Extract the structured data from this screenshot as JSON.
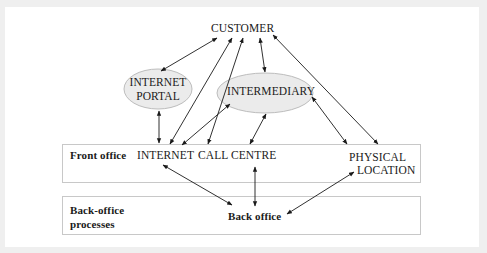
{
  "diagram": {
    "nodes": {
      "customer": "CUSTOMER",
      "internet_portal_line1": "INTERNET",
      "internet_portal_line2": "PORTAL",
      "intermediary": "INTERMEDIARY",
      "internet": "INTERNET",
      "call_centre": "CALL CENTRE",
      "physical_location_line1": "PHYSICAL",
      "physical_location_line2": "LOCATION",
      "back_office": "Back office"
    },
    "lanes": {
      "front_office": "Front office",
      "back_office_line1": "Back-office",
      "back_office_line2": "processes"
    },
    "edges": [
      {
        "from": "customer",
        "to": "internet_portal",
        "type": "bidirectional"
      },
      {
        "from": "customer",
        "to": "internet",
        "type": "bidirectional"
      },
      {
        "from": "customer",
        "to": "call_centre",
        "type": "bidirectional"
      },
      {
        "from": "customer",
        "to": "intermediary",
        "type": "bidirectional"
      },
      {
        "from": "customer",
        "to": "physical_location",
        "type": "bidirectional"
      },
      {
        "from": "internet_portal",
        "to": "internet",
        "type": "bidirectional"
      },
      {
        "from": "intermediary",
        "to": "internet",
        "type": "bidirectional"
      },
      {
        "from": "intermediary",
        "to": "call_centre",
        "type": "bidirectional"
      },
      {
        "from": "intermediary",
        "to": "physical_location",
        "type": "bidirectional"
      },
      {
        "from": "internet",
        "to": "back_office",
        "type": "bidirectional"
      },
      {
        "from": "call_centre",
        "to": "back_office",
        "type": "bidirectional"
      },
      {
        "from": "physical_location",
        "to": "back_office",
        "type": "bidirectional"
      }
    ],
    "colors": {
      "ellipse_fill": "#ebebeb",
      "ellipse_stroke": "#bdbdbd",
      "box_stroke": "#c8c8c8",
      "arrow": "#1a1a1a",
      "frame": "#efefef"
    }
  }
}
